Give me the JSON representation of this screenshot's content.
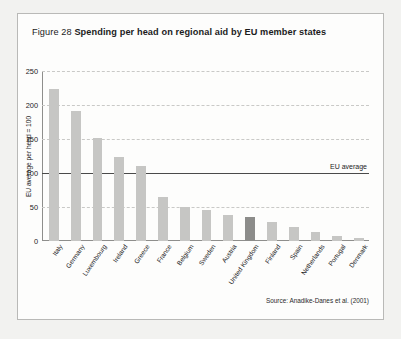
{
  "figure": {
    "number": "Figure 28",
    "title": "Spending per head on regional aid by EU member states",
    "source": "Source: Anadike-Danes et al. (2001)"
  },
  "colors": {
    "bar": "#c6c6c4",
    "bar_highlight": "#8c8c8a",
    "gridline": "#c9c9c7",
    "axis": "#8e8e8c",
    "average_line": "#4a4a4a",
    "frame": "#b9b9b7",
    "page": "#f2f2f0"
  },
  "chart_data": {
    "type": "bar",
    "title": "Spending per head on regional aid by EU member states",
    "xlabel": "",
    "ylabel": "EU average per head = 100",
    "ylim": [
      0,
      250
    ],
    "yticks": [
      0,
      50,
      100,
      150,
      200,
      250
    ],
    "grid": true,
    "legend": "none",
    "categories": [
      "Italy",
      "Germany",
      "Luxembourg",
      "Ireland",
      "Greece",
      "France",
      "Belgium",
      "Sweden",
      "Austria",
      "United Kingdom",
      "Finland",
      "Spain",
      "Netherlands",
      "Portugal",
      "Denmark"
    ],
    "values": [
      223,
      191,
      151,
      123,
      110,
      65,
      50,
      45,
      38,
      35,
      28,
      20,
      13,
      7,
      5
    ],
    "highlighted_category": "United Kingdom",
    "annotations": [
      {
        "label": "EU average",
        "y": 100,
        "line": "solid"
      }
    ]
  }
}
